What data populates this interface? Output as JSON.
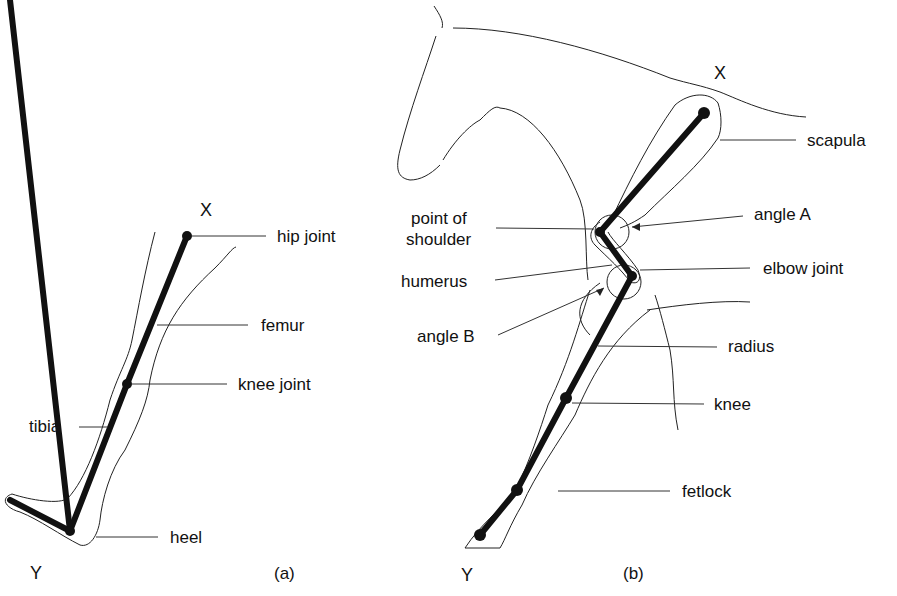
{
  "figure_a": {
    "caption": "(a)",
    "end_top": "X",
    "end_bottom": "Y",
    "labels": {
      "hip_joint": "hip joint",
      "femur": "femur",
      "knee_joint": "knee joint",
      "tibia": "tibia",
      "heel": "heel"
    }
  },
  "figure_b": {
    "caption": "(b)",
    "end_top": "X",
    "end_bottom": "Y",
    "labels": {
      "scapula": "scapula",
      "point_of_shoulder_1": "point of",
      "point_of_shoulder_2": "shoulder",
      "angle_a": "angle A",
      "humerus": "humerus",
      "elbow_joint": "elbow joint",
      "angle_b": "angle B",
      "radius": "radius",
      "knee": "knee",
      "fetlock": "fetlock"
    }
  }
}
